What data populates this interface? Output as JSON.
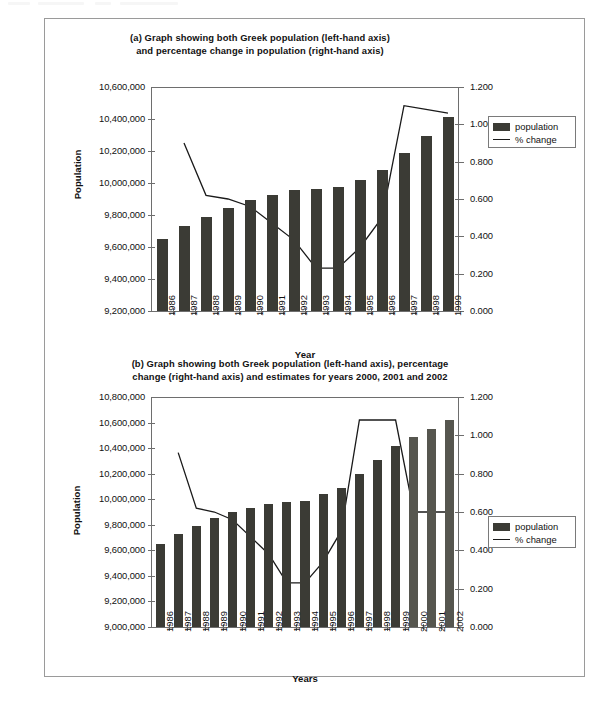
{
  "document": {
    "background_color": "#ffffff",
    "frame_border_color": "#9a9a9a"
  },
  "charts": [
    {
      "id": "chart-a",
      "title_line1": "(a) Graph showing both Greek population (left-hand axis)",
      "title_line2": "and percentage change in population (right-hand axis)",
      "legend": {
        "population_label": "population",
        "change_label": "% change"
      },
      "chart_data": {
        "type": "bar",
        "title": "(a) Graph showing both Greek population (left-hand axis) and percentage change in population (right-hand axis)",
        "xlabel": "Year",
        "ylabel": "Population",
        "ylabel_right": "",
        "categories": [
          "1986",
          "1987",
          "1988",
          "1989",
          "1990",
          "1991",
          "1992",
          "1993",
          "1994",
          "1995",
          "1996",
          "1997",
          "1998",
          "1999"
        ],
        "ylim": [
          9200000,
          10600000
        ],
        "ytick_labels": [
          "9,200,000",
          "9,400,000",
          "9,600,000",
          "9,800,000",
          "10,000,000",
          "10,200,000",
          "10,400,000",
          "10,600,000"
        ],
        "ylim_right": [
          0.0,
          1.2
        ],
        "ytick_labels_right": [
          "0.000",
          "0.200",
          "0.400",
          "0.600",
          "0.800",
          "1.000",
          "1.200"
        ],
        "grid": false,
        "legend_position": "right",
        "series": [
          {
            "name": "population",
            "type": "bar",
            "axis": "left",
            "color": "#3b3b35",
            "values": [
              9650000,
              9730000,
              9790000,
              9845000,
              9895000,
              9925000,
              9955000,
              9965000,
              9975000,
              10020000,
              10080000,
              10185000,
              10295000,
              10415000
            ]
          },
          {
            "name": "% change",
            "type": "line",
            "axis": "right",
            "color": "#1a1a1a",
            "values": [
              null,
              0.9,
              0.62,
              0.6,
              0.56,
              0.47,
              0.38,
              0.23,
              0.23,
              0.34,
              0.5,
              1.1,
              1.08,
              1.06
            ]
          }
        ]
      }
    },
    {
      "id": "chart-b",
      "title_line1": "(b) Graph showing both Greek population (left-hand axis), percentage",
      "title_line2": "change (right-hand axis) and estimates for years 2000, 2001 and 2002",
      "legend": {
        "population_label": "population",
        "change_label": "% change"
      },
      "chart_data": {
        "type": "bar",
        "title": "(b) Graph showing both Greek population (left-hand axis), percentage change (right-hand axis) and estimates for years 2000, 2001 and 2002",
        "xlabel": "Years",
        "ylabel": "Population",
        "ylabel_right": "",
        "categories": [
          "1986",
          "1987",
          "1988",
          "1989",
          "1990",
          "1991",
          "1992",
          "1993",
          "1994",
          "1995",
          "1996",
          "1997",
          "1998",
          "1999",
          "2000",
          "2001",
          "2002"
        ],
        "ylim": [
          9000000,
          10800000
        ],
        "ytick_labels": [
          "9,000,000",
          "9,200,000",
          "9,400,000",
          "9,600,000",
          "9,800,000",
          "10,000,000",
          "10,200,000",
          "10,400,000",
          "10,600,000",
          "10,800,000"
        ],
        "ylim_right": [
          0.0,
          1.2
        ],
        "ytick_labels_right": [
          "0.000",
          "0.200",
          "0.400",
          "0.600",
          "0.800",
          "1.000",
          "1.200"
        ],
        "grid": false,
        "legend_position": "right",
        "estimate_years": [
          "2000",
          "2001",
          "2002"
        ],
        "series": [
          {
            "name": "population",
            "type": "bar",
            "axis": "left",
            "color": "#3b3b35",
            "estimate_color": "#56564f",
            "values": [
              9650000,
              9730000,
              9790000,
              9850000,
              9900000,
              9930000,
              9960000,
              9975000,
              9990000,
              10040000,
              10090000,
              10200000,
              10310000,
              10420000,
              10485000,
              10550000,
              10620000
            ]
          },
          {
            "name": "% change",
            "type": "line",
            "axis": "right",
            "color": "#1a1a1a",
            "values": [
              null,
              0.91,
              0.62,
              0.6,
              0.56,
              0.47,
              0.38,
              0.23,
              0.23,
              0.34,
              0.5,
              1.08,
              1.08,
              1.08,
              0.6,
              0.6,
              0.6
            ]
          }
        ]
      }
    }
  ]
}
